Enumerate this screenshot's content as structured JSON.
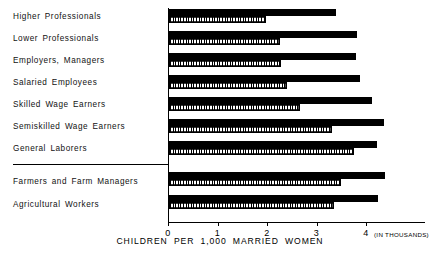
{
  "chart_data": {
    "type": "bar",
    "orientation": "horizontal",
    "title": "",
    "xlabel": "CHILDREN PER 1,000 MARRIED WOMEN",
    "ylabel": "",
    "unit_note": "(IN THOUSANDS)",
    "xlim": [
      0,
      4.4
    ],
    "xticks": [
      0,
      1,
      2,
      3,
      4
    ],
    "xticklabels": [
      "0",
      "1",
      "2",
      "3",
      "4"
    ],
    "grid": false,
    "legend": [],
    "categories": [
      "Higher Professionals",
      "Lower Professionals",
      "Employers, Managers",
      "Salaried Employees",
      "Skilled Wage Earners",
      "Semiskilled Wage Earners",
      "General Laborers",
      "Farmers and Farm Managers",
      "Agricultural Workers"
    ],
    "series": [
      {
        "name": "solid",
        "style": "solid-black",
        "values": [
          3.37,
          3.8,
          3.78,
          3.86,
          4.11,
          4.34,
          4.2,
          4.36,
          4.22
        ]
      },
      {
        "name": "hatched",
        "style": "vertical-hatch",
        "values": [
          1.96,
          2.24,
          2.26,
          2.38,
          2.65,
          3.29,
          3.73,
          3.47,
          3.33
        ]
      }
    ],
    "group_separator_after_category": "General Laborers"
  }
}
